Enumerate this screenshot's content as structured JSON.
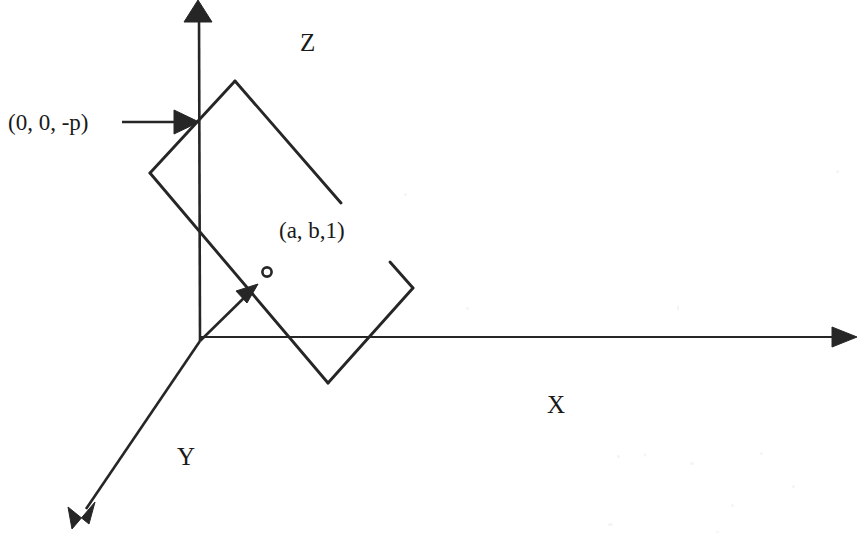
{
  "figure": {
    "width": 862,
    "height": 537,
    "background_color": "#ffffff",
    "ink_color": "#262626"
  },
  "axes": {
    "z": {
      "label": "Z",
      "label_x": 300,
      "label_y": 30,
      "line": {
        "x1": 199,
        "y1": 12,
        "x2": 200,
        "y2": 341
      },
      "arrow_tip": {
        "x": 198,
        "y": 0
      },
      "direction": "up"
    },
    "x": {
      "label": "X",
      "label_x": 547,
      "label_y": 392,
      "line": {
        "x1": 200,
        "y1": 337,
        "x2": 843,
        "y2": 337
      },
      "arrow_tip": {
        "x": 857,
        "y": 337
      },
      "direction": "right"
    },
    "y": {
      "label": "Y",
      "label_x": 177,
      "label_y": 444,
      "line": {
        "x1": 200,
        "y1": 341,
        "x2": 84,
        "y2": 511
      },
      "arrow_tip": {
        "x": 72,
        "y": 529
      },
      "direction": "down-left"
    }
  },
  "origin": {
    "x": 200,
    "y": 341
  },
  "plane": {
    "name": "tilted-quadrilateral-plane",
    "corners": {
      "top": {
        "x": 235,
        "y": 81
      },
      "left": {
        "x": 150,
        "y": 173
      },
      "bottom": {
        "x": 328,
        "y": 383
      },
      "right": {
        "x": 413,
        "y": 288
      }
    },
    "open_edge_end": {
      "x": 341,
      "y": 203
    },
    "open_edge_start": {
      "x": 235,
      "y": 81
    },
    "right_stub_end": {
      "x": 390,
      "y": 262
    }
  },
  "normal_vector": {
    "label": "normal-vector",
    "start": {
      "x": 200,
      "y": 341
    },
    "tip": {
      "x": 258,
      "y": 284
    }
  },
  "marker_circle": {
    "label": "o",
    "cx": 267,
    "cy": 272,
    "r": 4.5
  },
  "annotations": [
    {
      "id": "point-0-0-negp",
      "text": "(0, 0, -p)",
      "x": 8,
      "y": 111,
      "pointer": {
        "x1": 122,
        "y1": 122,
        "x2": 182,
        "y2": 122,
        "tip_x": 198,
        "tip_y": 122
      }
    },
    {
      "id": "point-a-b-1",
      "text": "(a, b,1)",
      "x": 279,
      "y": 219,
      "pointer": null
    }
  ],
  "scan_artifacts": {
    "ghost_text_top": "",
    "ghost_text_top_x": 22,
    "ghost_text_top_y": 20
  }
}
